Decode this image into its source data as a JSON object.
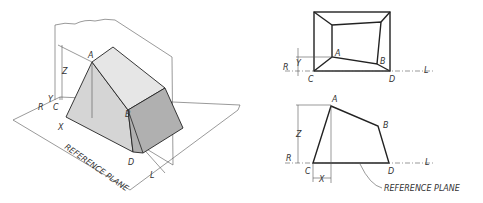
{
  "figure": {
    "pictorial": {
      "labels": {
        "A": "A",
        "B": "B",
        "C": "C",
        "D": "D",
        "R": "R",
        "L": "L",
        "X": "X",
        "Y": "Y",
        "Z": "Z"
      },
      "plane_label": "REFERENCE PLANE"
    },
    "top_view": {
      "labels": {
        "A": "A",
        "B": "B",
        "C": "C",
        "D": "D",
        "R": "R",
        "L": "L",
        "Y": "Y"
      }
    },
    "front_view": {
      "labels": {
        "A": "A",
        "B": "B",
        "C": "C",
        "D": "D",
        "R": "R",
        "L": "L",
        "X": "X",
        "Z": "Z"
      },
      "plane_label": "REFERENCE PLANE"
    }
  },
  "colors": {
    "line": "#333333",
    "shade_light": "#d8d8d8",
    "shade_dark": "#9a9a9a",
    "background": "#ffffff"
  }
}
